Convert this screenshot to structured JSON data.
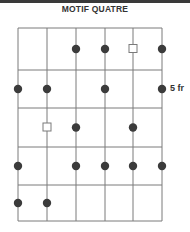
{
  "title": "MOTIF QUATRE",
  "fret_label": "5 fr",
  "colors": {
    "line": "#7a7a7a",
    "dot": "#3b3b3b",
    "text": "#333333"
  },
  "diagram": {
    "strings": 6,
    "frets": 5,
    "string_x": [
      18,
      47,
      76,
      105,
      133,
      162
    ],
    "fret_y": [
      28,
      70,
      108,
      147,
      185,
      221
    ],
    "notes": [
      {
        "fret": 1,
        "string": 3,
        "type": "dot"
      },
      {
        "fret": 1,
        "string": 4,
        "type": "dot"
      },
      {
        "fret": 1,
        "string": 5,
        "type": "square"
      },
      {
        "fret": 1,
        "string": 6,
        "type": "dot"
      },
      {
        "fret": 2,
        "string": 1,
        "type": "dot"
      },
      {
        "fret": 2,
        "string": 2,
        "type": "dot"
      },
      {
        "fret": 2,
        "string": 4,
        "type": "dot"
      },
      {
        "fret": 2,
        "string": 6,
        "type": "dot"
      },
      {
        "fret": 3,
        "string": 2,
        "type": "square"
      },
      {
        "fret": 3,
        "string": 3,
        "type": "dot"
      },
      {
        "fret": 3,
        "string": 5,
        "type": "dot"
      },
      {
        "fret": 4,
        "string": 1,
        "type": "dot"
      },
      {
        "fret": 4,
        "string": 3,
        "type": "dot"
      },
      {
        "fret": 4,
        "string": 4,
        "type": "dot"
      },
      {
        "fret": 4,
        "string": 5,
        "type": "dot"
      },
      {
        "fret": 4,
        "string": 6,
        "type": "dot"
      },
      {
        "fret": 5,
        "string": 1,
        "type": "dot"
      },
      {
        "fret": 5,
        "string": 2,
        "type": "dot"
      }
    ]
  }
}
